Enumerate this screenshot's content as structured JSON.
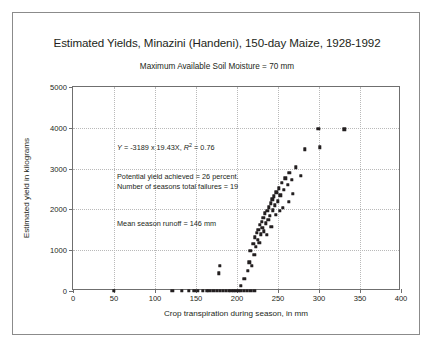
{
  "chart_data": {
    "type": "scatter",
    "title": "Estimated Yields, Minazini (Handeni), 150-day Maize, 1928-1992",
    "subtitle": "Maximum Available Soil Moisture = 70 mm",
    "xlabel": "Crop transpiration during season, in mm",
    "ylabel": "Estimated yield in kilograms",
    "xlim": [
      0,
      400
    ],
    "ylim": [
      0,
      5000
    ],
    "xticks": [
      0,
      50,
      100,
      150,
      200,
      250,
      300,
      350,
      400
    ],
    "yticks": [
      0,
      1000,
      2000,
      3000,
      4000,
      5000
    ],
    "grid": true,
    "legend": "none",
    "annotations": [
      "Y = -3189 x 19.43X, R2 = 0.76",
      "Potential yield achieved = 26 percent.",
      "Number of seasons total failures = 19",
      "Mean season runoff = 146 mm"
    ],
    "regression": {
      "intercept": -3189,
      "slope": 19.43,
      "r_squared": 0.76,
      "equation_prefix": "Y",
      "equation_body": " = -3189 x 19.43X, ",
      "r_symbol": "R",
      "r_exponent": "2",
      "r_value": " = 0.76"
    },
    "stats": {
      "potential_yield_achieved_percent": 26,
      "seasons_total_failures": 19,
      "mean_season_runoff_mm": 146
    },
    "points": [
      [
        50,
        0
      ],
      [
        121,
        0
      ],
      [
        133,
        0
      ],
      [
        141,
        0
      ],
      [
        148,
        0
      ],
      [
        152,
        0
      ],
      [
        158,
        0
      ],
      [
        163,
        0
      ],
      [
        166,
        0
      ],
      [
        171,
        0
      ],
      [
        175,
        0
      ],
      [
        179,
        0
      ],
      [
        183,
        0
      ],
      [
        186,
        0
      ],
      [
        190,
        0
      ],
      [
        193,
        0
      ],
      [
        196,
        0
      ],
      [
        199,
        0
      ],
      [
        202,
        0
      ],
      [
        205,
        0
      ],
      [
        208,
        0
      ],
      [
        212,
        0
      ],
      [
        216,
        0
      ],
      [
        221,
        0
      ],
      [
        178,
        430
      ],
      [
        179,
        620
      ],
      [
        205,
        120
      ],
      [
        209,
        300
      ],
      [
        213,
        500
      ],
      [
        215,
        700
      ],
      [
        216,
        980
      ],
      [
        218,
        620
      ],
      [
        220,
        1150
      ],
      [
        221,
        880
      ],
      [
        222,
        1320
      ],
      [
        223,
        1080
      ],
      [
        224,
        1420
      ],
      [
        225,
        1250
      ],
      [
        226,
        1500
      ],
      [
        227,
        1180
      ],
      [
        228,
        1620
      ],
      [
        229,
        1390
      ],
      [
        230,
        1700
      ],
      [
        231,
        1550
      ],
      [
        232,
        1800
      ],
      [
        233,
        1460
      ],
      [
        234,
        1900
      ],
      [
        235,
        1660
      ],
      [
        236,
        1380
      ],
      [
        237,
        1960
      ],
      [
        238,
        1750
      ],
      [
        239,
        2050
      ],
      [
        240,
        1850
      ],
      [
        241,
        2150
      ],
      [
        242,
        1580
      ],
      [
        243,
        2250
      ],
      [
        244,
        1980
      ],
      [
        245,
        2320
      ],
      [
        246,
        2100
      ],
      [
        247,
        1870
      ],
      [
        248,
        2420
      ],
      [
        250,
        2200
      ],
      [
        251,
        2520
      ],
      [
        253,
        2350
      ],
      [
        255,
        2650
      ],
      [
        257,
        2480
      ],
      [
        259,
        2760
      ],
      [
        262,
        2600
      ],
      [
        264,
        2900
      ],
      [
        267,
        2720
      ],
      [
        252,
        1960
      ],
      [
        256,
        2040
      ],
      [
        263,
        2180
      ],
      [
        268,
        2380
      ],
      [
        272,
        3030
      ],
      [
        278,
        2820
      ],
      [
        283,
        3470
      ],
      [
        299,
        3980
      ],
      [
        301,
        3520
      ],
      [
        331,
        3960
      ]
    ]
  }
}
